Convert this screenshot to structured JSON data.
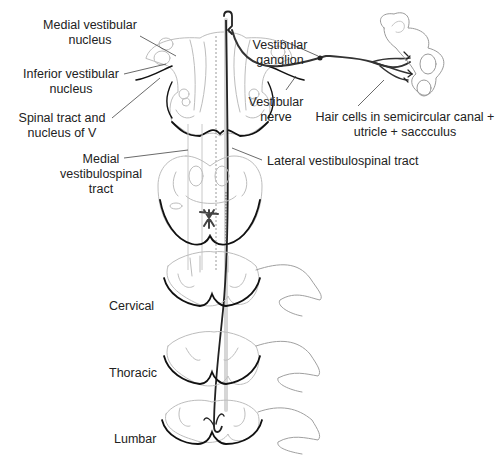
{
  "diagram": {
    "colors": {
      "outline_dark": "#111111",
      "outline_light": "#b8b8b8",
      "tract_dark": "#333333",
      "text": "#222222"
    },
    "labels": {
      "medial_vestibular_nucleus": "Medial vestibular\nnucleus",
      "inferior_vestibular_nucleus": "Inferior vestibular\nnucleus",
      "spinal_tract_nucleus_v": "Spinal tract and\nnucleus of V",
      "vestibular_ganglion": "Vestibular\nganglion",
      "vestibular_nerve": "Vestibular\nnerve",
      "hair_cells": "Hair cells in semicircular canal +\nutricle + saccculus",
      "medial_vestibulospinal_tract": "Medial\nvestibulospinal\ntract",
      "lateral_vestibulospinal_tract": "Lateral vestibulospinal tract",
      "cervical": "Cervical",
      "thoracic": "Thoracic",
      "lumbar": "Lumbar"
    }
  }
}
